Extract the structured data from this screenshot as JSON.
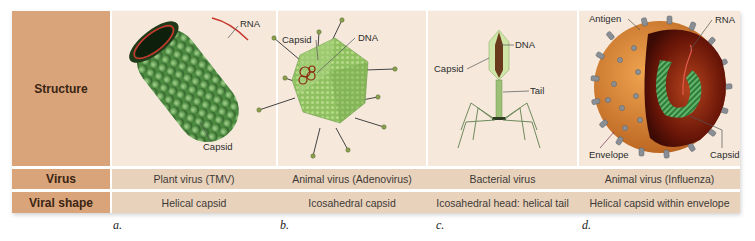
{
  "row_headers": {
    "structure": "Structure",
    "virus": "Virus",
    "viral_shape": "Viral shape"
  },
  "columns": [
    {
      "letter": "a.",
      "virus": "Plant virus (TMV)",
      "viral_shape": "Helical capsid",
      "labels": [
        "RNA",
        "Capsid"
      ]
    },
    {
      "letter": "b.",
      "virus": "Animal virus (Adenovirus)",
      "viral_shape": "Icosahedral capsid",
      "labels": [
        "Capsid",
        "DNA"
      ]
    },
    {
      "letter": "c.",
      "virus": "Bacterial virus",
      "viral_shape": "Icosahedral head: helical tail",
      "labels": [
        "DNA",
        "Capsid",
        "Tail"
      ]
    },
    {
      "letter": "d.",
      "virus": "Animal virus (Influenza)",
      "viral_shape": "Helical capsid within envelope",
      "labels": [
        "Antigen",
        "RNA",
        "Envelope",
        "Capsid"
      ]
    }
  ],
  "colors": {
    "header_bg": "#d9a47a",
    "image_bg": "#f6e9dc",
    "row_bg": "#e8d2bc",
    "capsid_green": "#5e9a4f",
    "rna_red": "#c8372d",
    "envelope_orange": "#d98a3a"
  }
}
